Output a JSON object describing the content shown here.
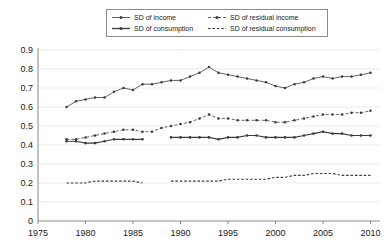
{
  "legend": {
    "position": "top-center",
    "entries": [
      {
        "label": "SD of income",
        "key": "income",
        "style": "solid-dot"
      },
      {
        "label": "SD of residual income",
        "key": "residual_income",
        "style": "dashed-dot"
      },
      {
        "label": "SD of consumption",
        "key": "consumption",
        "style": "solid-thick"
      },
      {
        "label": "SD of residual consumption",
        "key": "residual_consumption",
        "style": "dashed"
      }
    ]
  },
  "axes": {
    "x": {
      "ticks": [
        "1975",
        "1980",
        "1985",
        "1990",
        "1995",
        "2000",
        "2005",
        "2010"
      ],
      "min": 1975,
      "max": 2011,
      "label": ""
    },
    "y": {
      "ticks": [
        "0",
        "0.1",
        "0.2",
        "0.3",
        "0.4",
        "0.5",
        "0.6",
        "0.7",
        "0.8",
        "0.9"
      ],
      "min": 0,
      "max": 0.9,
      "label": ""
    }
  },
  "colors": {
    "line": "#3c3c3c",
    "grid": "#e4e4e4",
    "axis": "#7a7a7a",
    "text": "#1a1a1a",
    "background": "#ffffff"
  },
  "chart_data": {
    "type": "line",
    "title": "",
    "subtitle": "",
    "xlabel": "",
    "ylabel": "",
    "xlim": [
      1975,
      2011
    ],
    "ylim": [
      0,
      0.9
    ],
    "grid": true,
    "legend_position": "top-center",
    "series": [
      {
        "name": "SD of income",
        "style": "solid",
        "marker": "dot",
        "x": [
          1978,
          1979,
          1980,
          1981,
          1982,
          1983,
          1984,
          1985,
          1986,
          1987,
          1988,
          1989,
          1990,
          1991,
          1992,
          1993,
          1994,
          1995,
          1996,
          1997,
          1998,
          1999,
          2000,
          2001,
          2002,
          2003,
          2004,
          2005,
          2006,
          2007,
          2008,
          2009,
          2010
        ],
        "values": [
          0.6,
          0.63,
          0.64,
          0.65,
          0.65,
          0.68,
          0.7,
          0.69,
          0.72,
          0.72,
          0.73,
          0.74,
          0.74,
          0.76,
          0.78,
          0.81,
          0.78,
          0.77,
          0.76,
          0.75,
          0.74,
          0.73,
          0.71,
          0.7,
          0.72,
          0.73,
          0.75,
          0.76,
          0.75,
          0.76,
          0.76,
          0.77,
          0.78
        ]
      },
      {
        "name": "SD of residual income",
        "style": "dashed",
        "marker": "dot",
        "x": [
          1978,
          1979,
          1980,
          1981,
          1982,
          1983,
          1984,
          1985,
          1986,
          1987,
          1988,
          1989,
          1990,
          1991,
          1992,
          1993,
          1994,
          1995,
          1996,
          1997,
          1998,
          1999,
          2000,
          2001,
          2002,
          2003,
          2004,
          2005,
          2006,
          2007,
          2008,
          2009,
          2010
        ],
        "values": [
          0.43,
          0.43,
          0.44,
          0.45,
          0.46,
          0.47,
          0.48,
          0.48,
          0.47,
          0.47,
          0.49,
          0.5,
          0.51,
          0.52,
          0.54,
          0.56,
          0.54,
          0.54,
          0.53,
          0.53,
          0.53,
          0.53,
          0.52,
          0.52,
          0.53,
          0.54,
          0.55,
          0.56,
          0.56,
          0.56,
          0.57,
          0.57,
          0.58
        ]
      },
      {
        "name": "SD of consumption",
        "style": "solid",
        "marker": "dot",
        "segments": [
          {
            "x": [
              1978,
              1979,
              1980,
              1981,
              1982,
              1983,
              1984,
              1985,
              1986
            ],
            "values": [
              0.42,
              0.42,
              0.41,
              0.41,
              0.42,
              0.43,
              0.43,
              0.43,
              0.43
            ]
          },
          {
            "x": [
              1989,
              1990,
              1991,
              1992,
              1993,
              1994,
              1995,
              1996,
              1997,
              1998,
              1999,
              2000,
              2001,
              2002,
              2003,
              2004,
              2005,
              2006,
              2007,
              2008,
              2009,
              2010
            ],
            "values": [
              0.44,
              0.44,
              0.44,
              0.44,
              0.44,
              0.43,
              0.44,
              0.44,
              0.45,
              0.45,
              0.44,
              0.44,
              0.44,
              0.44,
              0.45,
              0.46,
              0.47,
              0.46,
              0.46,
              0.45,
              0.45,
              0.45
            ]
          }
        ]
      },
      {
        "name": "SD of residual consumption",
        "style": "dashed",
        "marker": "none",
        "segments": [
          {
            "x": [
              1978,
              1979,
              1980,
              1981,
              1982,
              1983,
              1984,
              1985,
              1986
            ],
            "values": [
              0.2,
              0.2,
              0.2,
              0.21,
              0.21,
              0.21,
              0.21,
              0.21,
              0.2
            ]
          },
          {
            "x": [
              1989,
              1990,
              1991,
              1992,
              1993,
              1994,
              1995,
              1996,
              1997,
              1998,
              1999,
              2000,
              2001,
              2002,
              2003,
              2004,
              2005,
              2006,
              2007,
              2008,
              2009,
              2010
            ],
            "values": [
              0.21,
              0.21,
              0.21,
              0.21,
              0.21,
              0.21,
              0.22,
              0.22,
              0.22,
              0.22,
              0.22,
              0.23,
              0.23,
              0.24,
              0.24,
              0.25,
              0.25,
              0.25,
              0.24,
              0.24,
              0.24,
              0.24
            ]
          }
        ]
      }
    ]
  }
}
